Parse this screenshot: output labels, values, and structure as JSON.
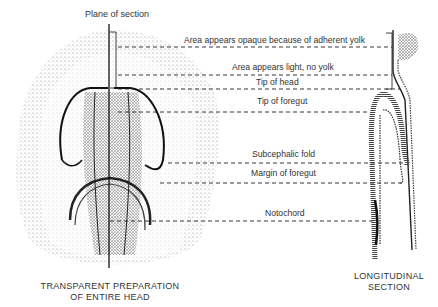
{
  "figure": {
    "plane_label": "Plane of section",
    "labels": [
      {
        "text": "Area appears opaque because of adherent yolk",
        "x": 184,
        "y": 35,
        "line_y": 47,
        "line_x1": 118,
        "line_x2": 392
      },
      {
        "text": "Area appears light, no yolk",
        "x": 232,
        "y": 62,
        "line_y": 75,
        "line_x1": 118,
        "line_x2": 392
      },
      {
        "text": "Tip of head",
        "x": 256,
        "y": 77,
        "line_y": 89,
        "line_x1": 118,
        "line_x2": 400
      },
      {
        "text": "Tip of foregut",
        "x": 257,
        "y": 96,
        "line_y": 112,
        "line_x1": 118,
        "line_x2": 370
      },
      {
        "text": "Subcephalic fold",
        "x": 252,
        "y": 149,
        "line_y": 163,
        "line_x1": 168,
        "line_x2": 405
      },
      {
        "text": "Margin of foregut",
        "x": 251,
        "y": 168,
        "line_y": 183,
        "line_x1": 160,
        "line_x2": 404
      },
      {
        "text": "Notochord",
        "x": 265,
        "y": 208,
        "line_y": 221,
        "line_x1": 110,
        "line_x2": 376
      }
    ],
    "captions": {
      "left_line1": "TRANSPARENT PREPARATION",
      "left_line2": "OF ENTIRE HEAD",
      "right_line1": "LONGITUDINAL",
      "right_line2": "SECTION"
    },
    "colors": {
      "ink": "#222222",
      "stipple": "#888888",
      "background": "#ffffff"
    }
  }
}
